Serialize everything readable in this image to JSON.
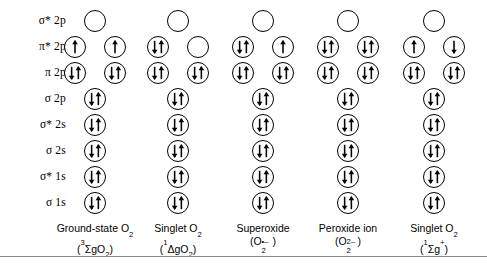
{
  "figure": {
    "background_color": "#ffffff",
    "line_color": "#000000"
  },
  "orbital_rows": [
    {
      "id": "sigma-star-2p",
      "label_symbol": "σ*",
      "label_shell": "2p",
      "double": true
    },
    {
      "id": "pi-star-2p",
      "label_symbol": "π*",
      "label_shell": "2p",
      "double": true
    },
    {
      "id": "pi-2p",
      "label_symbol": "π",
      "label_shell": "2p",
      "double": true
    },
    {
      "id": "sigma-2p",
      "label_symbol": "σ",
      "label_shell": "2p",
      "double": false
    },
    {
      "id": "sigma-star-2s",
      "label_symbol": "σ*",
      "label_shell": "2s",
      "double": false
    },
    {
      "id": "sigma-2s",
      "label_symbol": "σ",
      "label_shell": "2s",
      "double": false
    },
    {
      "id": "sigma-star-1s",
      "label_symbol": "σ*",
      "label_shell": "1s",
      "double": false
    },
    {
      "id": "sigma-1s",
      "label_symbol": "σ",
      "label_shell": "1s",
      "double": false
    }
  ],
  "row_labels": [
    "σ* 2p",
    "π* 2p",
    "π 2p",
    "σ 2p",
    "σ* 2s",
    "σ 2s",
    "σ* 1s",
    "σ 1s"
  ],
  "columns": [
    {
      "id": "ground-state-o2",
      "name_line1": "Ground-state O",
      "name_sub1": "2",
      "term_open": "(",
      "term_pre_sup": "3",
      "term_body": "ΣgO",
      "term_body_sub": "2",
      "term_close": ")",
      "occupancy": {
        "sigma-star-2p": [
          "empty"
        ],
        "pi-star-2p": [
          "up",
          "up"
        ],
        "pi-2p": [
          "pair",
          "pair"
        ],
        "sigma-2p": [
          "pair"
        ],
        "sigma-star-2s": [
          "pair"
        ],
        "sigma-2s": [
          "pair"
        ],
        "sigma-star-1s": [
          "pair"
        ],
        "sigma-1s": [
          "pair"
        ]
      }
    },
    {
      "id": "singlet-o2-delta",
      "name_line1": "Singlet O",
      "name_sub1": "2",
      "term_open": "(",
      "term_pre_sup": "1",
      "term_body": "ΔgO",
      "term_body_sub": "2",
      "term_close": ")",
      "occupancy": {
        "sigma-star-2p": [
          "empty"
        ],
        "pi-star-2p": [
          "pair",
          "empty"
        ],
        "pi-2p": [
          "pair",
          "pair"
        ],
        "sigma-2p": [
          "pair"
        ],
        "sigma-star-2s": [
          "pair"
        ],
        "sigma-2s": [
          "pair"
        ],
        "sigma-star-1s": [
          "pair"
        ],
        "sigma-1s": [
          "pair"
        ]
      }
    },
    {
      "id": "superoxide",
      "name_line1": "Superoxide",
      "name_sub1": "",
      "term_open": "(O",
      "term_pre_sup": "",
      "term_body": "",
      "term_body_sub": "2",
      "term_charge_top": "•–",
      "term_close": ")",
      "occupancy": {
        "sigma-star-2p": [
          "empty"
        ],
        "pi-star-2p": [
          "pair",
          "up"
        ],
        "pi-2p": [
          "pair",
          "pair"
        ],
        "sigma-2p": [
          "pair"
        ],
        "sigma-star-2s": [
          "pair"
        ],
        "sigma-2s": [
          "pair"
        ],
        "sigma-star-1s": [
          "pair"
        ],
        "sigma-1s": [
          "pair"
        ]
      }
    },
    {
      "id": "peroxide-ion",
      "name_line1": "Peroxide ion",
      "name_sub1": "",
      "term_open": "(O",
      "term_pre_sup": "",
      "term_body": "",
      "term_body_sub": "2",
      "term_charge_top": "2–",
      "term_close": ")",
      "occupancy": {
        "sigma-star-2p": [
          "empty"
        ],
        "pi-star-2p": [
          "pair",
          "pair"
        ],
        "pi-2p": [
          "pair",
          "pair"
        ],
        "sigma-2p": [
          "pair"
        ],
        "sigma-star-2s": [
          "pair"
        ],
        "sigma-2s": [
          "pair"
        ],
        "sigma-star-1s": [
          "pair"
        ],
        "sigma-1s": [
          "pair"
        ]
      }
    },
    {
      "id": "singlet-o2-sigma",
      "name_line1": "Singlet O",
      "name_sub1": "2",
      "term_open": "(",
      "term_pre_sup": "1",
      "term_body": "Σg",
      "term_body_sub": "",
      "term_post_sup": "+",
      "term_close": ")",
      "occupancy": {
        "sigma-star-2p": [
          "empty"
        ],
        "pi-star-2p": [
          "up",
          "down"
        ],
        "pi-2p": [
          "pair",
          "pair"
        ],
        "sigma-2p": [
          "pair"
        ],
        "sigma-star-2s": [
          "pair"
        ],
        "sigma-2s": [
          "pair"
        ],
        "sigma-star-1s": [
          "pair"
        ],
        "sigma-1s": [
          "pair"
        ]
      }
    }
  ],
  "caption_texts": {
    "col0_line1": "Ground-state O2",
    "col0_line2": "(3ΣgO2)",
    "col1_line1": "Singlet O2",
    "col1_line2": "(1ΔgO2)",
    "col2_line1": "Superoxide",
    "col2_line2": "(O2•–)",
    "col3_line1": "Peroxide ion",
    "col3_line2": "(O22–)",
    "col4_line1": "Singlet O2",
    "col4_line2": "(1Σg+)"
  }
}
